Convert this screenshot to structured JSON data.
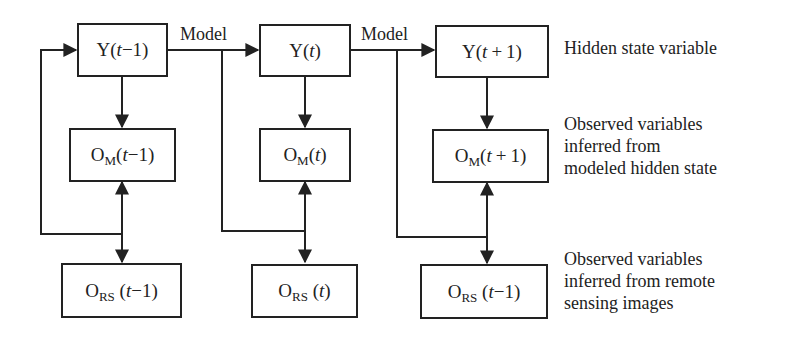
{
  "diagram": {
    "type": "flowchart",
    "edge_labels": {
      "model_1": "Model",
      "model_2": "Model"
    },
    "rows": {
      "hidden": {
        "label_lines": [
          "Hidden state variable"
        ],
        "nodes": [
          {
            "id": "y_prev",
            "main": "Y",
            "sub": "",
            "paren_open": "(",
            "var": "t",
            "op": "−",
            "num": "1",
            "paren_close": ")"
          },
          {
            "id": "y_curr",
            "main": "Y",
            "sub": "",
            "paren_open": "(",
            "var": "t",
            "op": "",
            "num": "",
            "paren_close": ")"
          },
          {
            "id": "y_next",
            "main": "Y",
            "sub": "",
            "paren_open": "(",
            "var": "t",
            "op": "+",
            "num": "1",
            "paren_close": ")"
          }
        ]
      },
      "modeled_obs": {
        "label_lines": [
          "Observed variables",
          "inferred from",
          "modeled hidden state"
        ],
        "nodes": [
          {
            "id": "om_prev",
            "main": "O",
            "sub": "M",
            "paren_open": "(",
            "var": "t",
            "op": "−",
            "num": "1",
            "paren_close": ")"
          },
          {
            "id": "om_curr",
            "main": "O",
            "sub": "M",
            "paren_open": "(",
            "var": "t",
            "op": "",
            "num": "",
            "paren_close": ")"
          },
          {
            "id": "om_next",
            "main": "O",
            "sub": "M",
            "paren_open": "(",
            "var": "t",
            "op": "+",
            "num": "1",
            "paren_close": ")"
          }
        ]
      },
      "rs_obs": {
        "label_lines": [
          "Observed variables",
          "inferred from remote",
          "sensing images"
        ],
        "nodes": [
          {
            "id": "ors_prev",
            "main": "O",
            "sub": "RS",
            "paren_open": " (",
            "var": "t",
            "op": "−",
            "num": "1",
            "paren_close": ")"
          },
          {
            "id": "ors_curr",
            "main": "O",
            "sub": "RS",
            "paren_open": " (",
            "var": "t",
            "op": "",
            "num": "",
            "paren_close": ")"
          },
          {
            "id": "ors_next",
            "main": "O",
            "sub": "RS",
            "paren_open": " (",
            "var": "t",
            "op": "−",
            "num": "1",
            "paren_close": ")"
          }
        ]
      }
    },
    "edges": [
      {
        "from": "y_prev",
        "to": "y_curr",
        "label": "Model"
      },
      {
        "from": "y_curr",
        "to": "y_next",
        "label": "Model"
      },
      {
        "from": "y_prev",
        "to": "om_prev"
      },
      {
        "from": "y_curr",
        "to": "om_curr"
      },
      {
        "from": "y_next",
        "to": "om_next"
      },
      {
        "from": "om_prev",
        "to": "ors_prev",
        "bidirectional": true
      },
      {
        "from": "om_curr",
        "to": "ors_curr",
        "bidirectional": true
      },
      {
        "from": "om_next",
        "to": "ors_next",
        "bidirectional": true
      },
      {
        "from": "ors_prev",
        "to": "y_prev",
        "note": "feedback loop"
      },
      {
        "from": "model_1",
        "to": "ors_curr",
        "note": "feedback branch"
      },
      {
        "from": "model_2",
        "to": "ors_next",
        "note": "feedback branch"
      }
    ],
    "colors": {
      "line": "#222222",
      "background": "#ffffff",
      "text": "#222222"
    }
  }
}
